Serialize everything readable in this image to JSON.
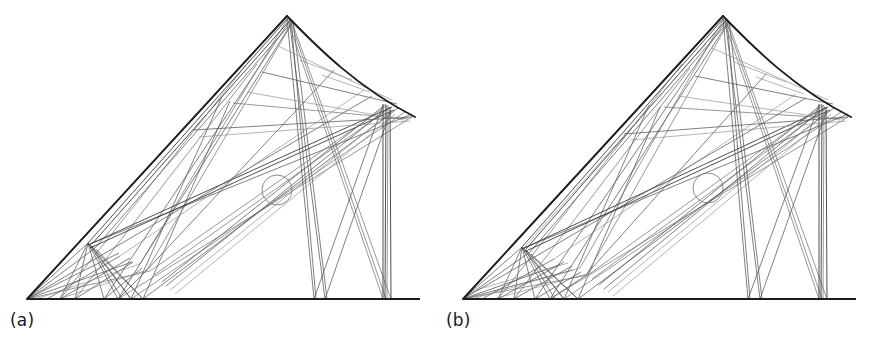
{
  "figure": {
    "type": "two-panel-line-diagram",
    "background_color": "#ffffff",
    "line_color_primary": "#1c1c1c",
    "line_color_rays": "#55565a",
    "width": 873,
    "height": 348
  },
  "panels": [
    {
      "id": "a",
      "label": "(a)",
      "geometry": {
        "baseline": {
          "x1": 27,
          "y1": 299,
          "x2": 420,
          "y2": 299
        },
        "origin": {
          "x": 27,
          "y": 299
        },
        "apex": {
          "x": 287,
          "y": 16
        },
        "curve_end": {
          "x": 415,
          "y": 117
        },
        "left_edge": "straight from origin to apex",
        "right_edge": "convex curve from apex to curve_end",
        "marker_circle": {
          "cx": 277,
          "cy": 190,
          "r": 15
        },
        "vertical_bundle_x": [
          383,
          386,
          391
        ],
        "v_notch_baseline_x": [
          314,
          325
        ]
      }
    },
    {
      "id": "b",
      "label": "(b)",
      "geometry": {
        "baseline": {
          "x1": 27,
          "y1": 299,
          "x2": 420,
          "y2": 299
        },
        "origin": {
          "x": 27,
          "y": 299
        },
        "apex": {
          "x": 287,
          "y": 16
        },
        "curve_end": {
          "x": 415,
          "y": 117
        },
        "left_edge": "straight from origin to apex",
        "right_edge": "convex curve from apex to curve_end",
        "marker_circle": {
          "cx": 272,
          "cy": 188,
          "r": 15
        },
        "vertical_bundle_x": [
          383,
          386,
          391
        ],
        "v_notch_baseline_x": [
          312,
          324
        ]
      }
    }
  ]
}
